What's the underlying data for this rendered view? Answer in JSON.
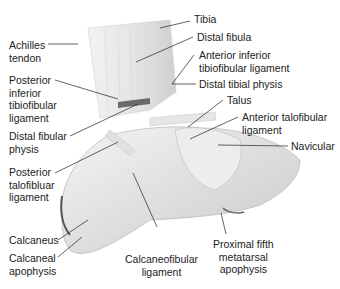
{
  "labels": {
    "tibia": "Tibia",
    "distal_fibula": "Distal fibula",
    "aitfl_1": "Anterior inferior",
    "aitfl_2": "tibiofibular ligament",
    "distal_tibial_physis": "Distal tibial physis",
    "talus": "Talus",
    "atfl_1": "Anterior talofibular",
    "atfl_2": "ligament",
    "navicular": "Navicular",
    "achilles_1": "Achilles",
    "achilles_2": "tendon",
    "pitfl_1": "Posterior",
    "pitfl_2": "inferior",
    "pitfl_3": "tibiofibular",
    "pitfl_4": "ligament",
    "dfp_1": "Distal fibular",
    "dfp_2": "physis",
    "ptfl_1": "Posterior",
    "ptfl_2": "talofibluar",
    "ptfl_3": "ligament",
    "calcaneus": "Calcaneus",
    "calc_apo_1": "Calcaneal",
    "calc_apo_2": "apophysis",
    "cfl_1": "Calcaneofibular",
    "cfl_2": "ligament",
    "pfma_1": "Proximal fifth",
    "pfma_2": "metatarsal",
    "pfma_3": "apophysis"
  }
}
